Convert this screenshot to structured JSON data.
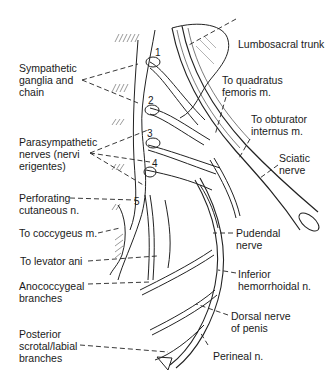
{
  "figure": {
    "vertebral_levels": [
      "1",
      "2",
      "3",
      "4",
      "5"
    ],
    "labels_left": [
      {
        "id": "sympathetic",
        "text": "Sympathetic\nganglia and\nchain"
      },
      {
        "id": "parasympathetic",
        "text": "Parasympathetic\nnerves (nervi\nerigentes)"
      },
      {
        "id": "perforating",
        "text": "Perforating\ncutaneous n."
      },
      {
        "id": "coccygeus",
        "text": "To coccygeus m."
      },
      {
        "id": "levator",
        "text": "To levator ani"
      },
      {
        "id": "anococcygeal",
        "text": "Anococcygeal\nbranches"
      },
      {
        "id": "posterior-scrotal",
        "text": "Posterior\nscrotal/labial\nbranches"
      }
    ],
    "labels_right": [
      {
        "id": "lumbosacral",
        "text": "Lumbosacral trunk"
      },
      {
        "id": "quadratus",
        "text": "To quadratus\nfemoris m."
      },
      {
        "id": "obturator",
        "text": "To obturator\ninternus m."
      },
      {
        "id": "sciatic",
        "text": "Sciatic\nnerve"
      },
      {
        "id": "pudendal",
        "text": "Pudendal\nnerve"
      },
      {
        "id": "inferior-hemorrhoidal",
        "text": "Inferior\nhemorrhoidal n."
      },
      {
        "id": "dorsal-penis",
        "text": "Dorsal nerve\nof penis"
      },
      {
        "id": "perineal",
        "text": "Perineal n."
      }
    ]
  }
}
